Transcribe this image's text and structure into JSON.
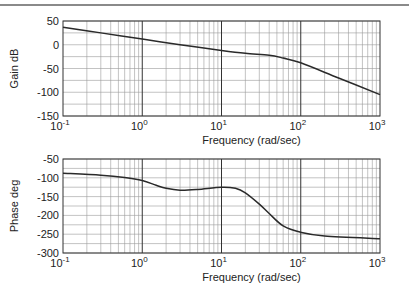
{
  "chart_data": [
    {
      "type": "line",
      "title": "",
      "xlabel": "Frequency (rad/sec)",
      "ylabel": "Gain dB",
      "xscale": "log",
      "xlim": [
        0.1,
        1000
      ],
      "ylim": [
        -150,
        50
      ],
      "x_ticks": [
        "10^-1",
        "10^0",
        "10^1",
        "10^2",
        "10^3"
      ],
      "y_ticks": [
        "50",
        "0",
        "-50",
        "-100",
        "-150"
      ],
      "grid": true,
      "series": [
        {
          "name": "Gain",
          "x": [
            0.1,
            0.3,
            1,
            3,
            10,
            20,
            40,
            60,
            100,
            300,
            1000
          ],
          "values": [
            37,
            25,
            12,
            0,
            -12,
            -18,
            -22,
            -28,
            -38,
            -70,
            -105
          ]
        }
      ]
    },
    {
      "type": "line",
      "title": "",
      "xlabel": "Frequency (rad/sec)",
      "ylabel": "Phase deg",
      "xscale": "log",
      "xlim": [
        0.1,
        1000
      ],
      "ylim": [
        -300,
        -50
      ],
      "x_ticks": [
        "10^-1",
        "10^0",
        "10^1",
        "10^2",
        "10^3"
      ],
      "y_ticks": [
        "-50",
        "-100",
        "-150",
        "-200",
        "-250",
        "-300"
      ],
      "grid": true,
      "series": [
        {
          "name": "Phase",
          "x": [
            0.1,
            0.3,
            0.6,
            1,
            1.5,
            2,
            3,
            5,
            10,
            15,
            20,
            30,
            40,
            60,
            100,
            200,
            1000
          ],
          "values": [
            -88,
            -93,
            -99,
            -107,
            -120,
            -128,
            -133,
            -131,
            -125,
            -128,
            -140,
            -170,
            -195,
            -228,
            -245,
            -255,
            -262
          ]
        }
      ]
    }
  ],
  "labels": {
    "gain_ylabel": "Gain dB",
    "phase_ylabel": "Phase deg",
    "xlabel_top": "Frequency (rad/sec)",
    "xlabel_bottom": "Frequency (rad/sec)",
    "gain_yticks": [
      "50",
      "0",
      "-50",
      "-100",
      "-150"
    ],
    "phase_yticks": [
      "-50",
      "-100",
      "-150",
      "-200",
      "-250",
      "-300"
    ],
    "x_base": "10",
    "x_exps": [
      "-1",
      "0",
      "1",
      "2",
      "3"
    ]
  }
}
